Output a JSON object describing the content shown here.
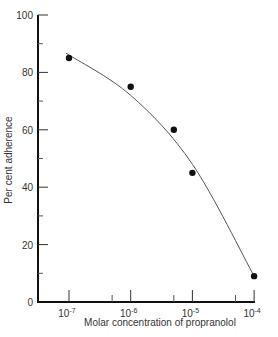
{
  "chart_data": {
    "type": "scatter",
    "title": "",
    "xlabel": "Molar concentration of propranolol",
    "ylabel": "Per cent adherence",
    "xscale": "log",
    "xlim": [
      3e-08,
      0.0001
    ],
    "ylim": [
      0,
      100
    ],
    "grid": false,
    "legend": null,
    "x_ticks": [
      {
        "value": 1e-07,
        "label_base": "10",
        "label_exp": "-7"
      },
      {
        "value": 1e-06,
        "label_base": "10",
        "label_exp": "-6"
      },
      {
        "value": 1e-05,
        "label_base": "10",
        "label_exp": "-5"
      },
      {
        "value": 0.0001,
        "label_base": "10",
        "label_exp": "-4"
      }
    ],
    "x_minor_ticks": [
      5e-07,
      5e-06,
      5e-05
    ],
    "y_ticks": [
      0,
      20,
      40,
      60,
      80,
      100
    ],
    "y_minor_ticks": [
      10,
      30,
      50,
      70,
      90
    ],
    "series": [
      {
        "name": "Observed",
        "marker": "circle",
        "x": [
          1e-07,
          1e-06,
          5e-06,
          1e-05,
          0.0001
        ],
        "y": [
          85,
          75,
          60,
          45,
          9
        ]
      },
      {
        "name": "Fitted curve",
        "marker": "line",
        "x": [
          1e-07,
          1e-06,
          1e-05,
          0.0001
        ],
        "y": [
          86,
          72,
          48,
          9
        ]
      }
    ]
  }
}
